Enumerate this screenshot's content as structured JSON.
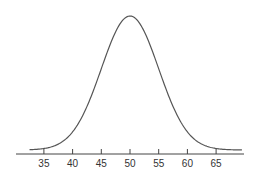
{
  "chart_data": {
    "type": "line",
    "title": "",
    "xlabel": "",
    "ylabel": "",
    "distribution": {
      "mean": 50,
      "sd": 5
    },
    "xlim": [
      30,
      70
    ],
    "x_ticks": [
      35,
      40,
      45,
      50,
      55,
      60,
      65
    ],
    "x_tick_labels": [
      "35",
      "40",
      "45",
      "50",
      "55",
      "60",
      "65"
    ],
    "grid": false,
    "legend": null,
    "series": [
      {
        "name": "density",
        "color": "#555555"
      }
    ]
  }
}
